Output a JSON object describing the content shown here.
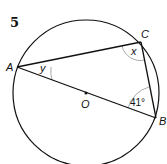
{
  "question_number": "5",
  "points": {
    "A": {
      "label": "A",
      "x": 17,
      "y": 67
    },
    "B": {
      "label": "B",
      "x": 156,
      "y": 118
    },
    "C": {
      "label": "C",
      "x": 141,
      "y": 42
    },
    "O": {
      "label": "O",
      "x": 86,
      "y": 93
    }
  },
  "circle": {
    "cx": 86,
    "cy": 93,
    "r": 73
  },
  "angles": {
    "at_A": "y",
    "at_C": "x",
    "at_B": "41°"
  },
  "colors": {
    "line": "#111111",
    "arc": "#aaaaaa"
  }
}
